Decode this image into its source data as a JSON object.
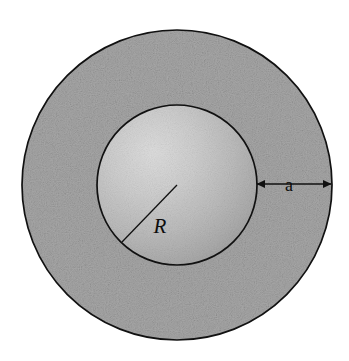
{
  "figure": {
    "background_color": "#ffffff",
    "width": 349,
    "height": 361
  },
  "labels": {
    "inner_radius": "R",
    "shell_thickness": "a"
  },
  "geometry": {
    "center_x": 177,
    "center_y": 185,
    "outer_radius": 155,
    "inner_radius": 80,
    "shell_thickness": 75,
    "radius_line": {
      "x1": 177,
      "y1": 185,
      "x2": 122,
      "y2": 242
    },
    "thickness_arrow": {
      "x1": 257,
      "y1": 184,
      "x2": 331,
      "y2": 184
    }
  },
  "colors": {
    "outline": "#111111",
    "shell_fill": "#a8a8a8",
    "sphere_light": "#d6d6d6",
    "sphere_mid": "#bdbdbd",
    "sphere_dark": "#9a9a9a",
    "label_color": "#0d0d0d",
    "background": "#ffffff"
  },
  "label_positions": {
    "inner_radius": {
      "x": 160,
      "y": 233
    },
    "shell_thickness": {
      "x": 289,
      "y": 184
    }
  }
}
